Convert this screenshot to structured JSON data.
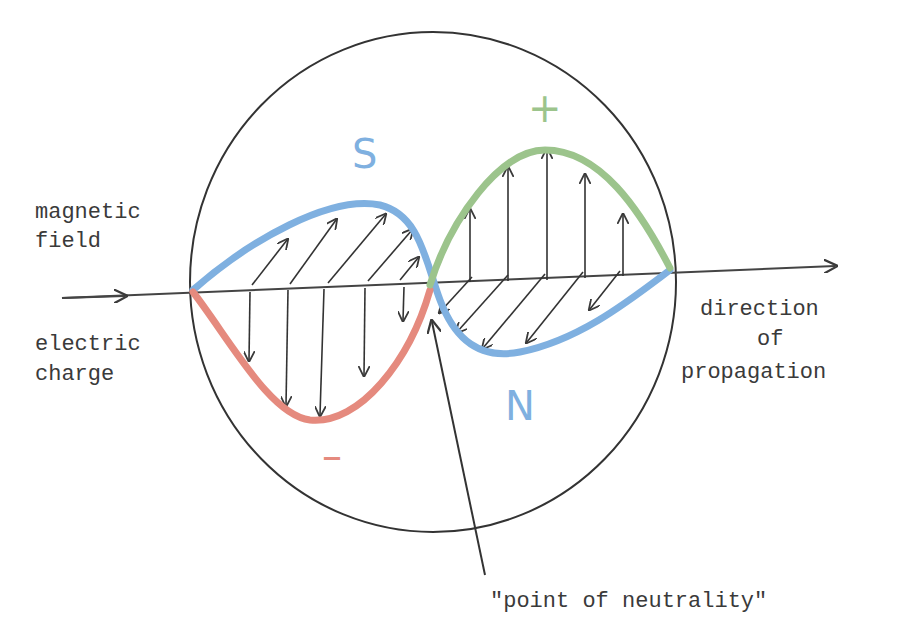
{
  "diagram": {
    "labels": {
      "magnetic_line1": "magnetic",
      "magnetic_line2": "field",
      "electric_line1": "electric",
      "electric_line2": "charge",
      "direction_line1": "direction",
      "direction_line2": "of",
      "direction_line3": "propagation",
      "neutral_point": "\"point of neutrality\""
    },
    "symbols": {
      "south": "S",
      "north": "N",
      "plus": "+",
      "minus": "–"
    },
    "colors": {
      "magnetic_wave": "#7fb0e0",
      "electric_positive": "#9cc48c",
      "electric_negative": "#e58a7e",
      "ink": "#3a3a3a"
    }
  }
}
